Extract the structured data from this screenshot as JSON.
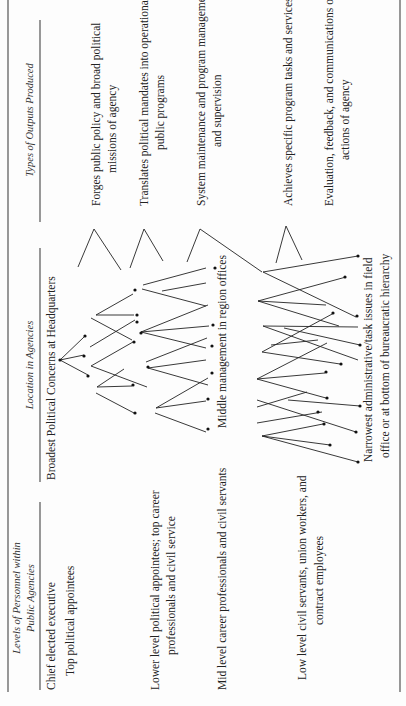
{
  "columns": {
    "personnel": {
      "header_line1": "Levels of Personnel within",
      "header_line2": "Public Agencies",
      "items": [
        {
          "lines": [
            "Chief elected executive"
          ]
        },
        {
          "lines": [
            "Top political appointees"
          ]
        },
        {
          "lines": [
            "Lower level political appointees; top career",
            "professionals and civil service"
          ]
        },
        {
          "lines": [
            "Mid level career professionals and civil servants"
          ]
        },
        {
          "lines": [
            "Low level civil servants, union workers, and",
            "contract employees"
          ]
        }
      ]
    },
    "location": {
      "header": "Location in Agencies",
      "items": [
        {
          "lines": [
            "Broadest Political Concerns at Headquarters"
          ]
        },
        {
          "lines": [
            "Middle management in region offices"
          ]
        },
        {
          "lines": [
            "Narrowest administrative/task issues in field",
            "office or at bottom of bureaucratic hierarchy"
          ]
        }
      ]
    },
    "outputs": {
      "header": "Types of Outputs Produced",
      "items": [
        {
          "lines": [
            "Forges public policy and broad political",
            "missions of agency"
          ]
        },
        {
          "lines": [
            "Translates political mandates into operational",
            "public programs"
          ]
        },
        {
          "lines": [
            "System maintenance and program management",
            "and supervision"
          ]
        },
        {
          "lines": [
            "Achieves specific program tasks and services"
          ]
        },
        {
          "lines": [
            "Evaluation, feedback, and communications on",
            "actions of agency"
          ]
        }
      ]
    }
  }
}
